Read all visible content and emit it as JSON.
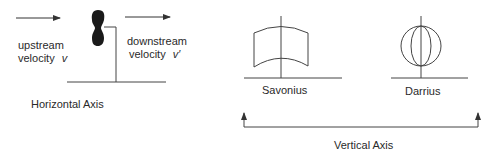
{
  "diagram": {
    "colors": {
      "stroke": "#333333",
      "blade_fill": "#1a1a1a",
      "text": "#2a2a2a",
      "background": "#ffffff"
    },
    "horizontal_axis": {
      "caption": "Horizontal Axis",
      "upstream": {
        "line1": "upstream",
        "line2_prefix": "velocity",
        "symbol": "v"
      },
      "downstream": {
        "line1": "downstream",
        "line2_prefix": "velocity",
        "symbol": "v′"
      }
    },
    "vertical_axis": {
      "caption": "Vertical Axis",
      "turbines": [
        {
          "name": "Savonius"
        },
        {
          "name": "Darrius"
        }
      ]
    }
  }
}
